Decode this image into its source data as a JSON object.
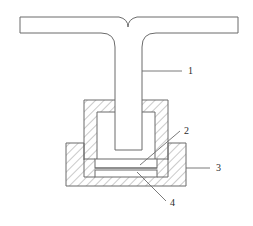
{
  "figure": {
    "domain": "engineering-cross-section-diagram",
    "background_color": "#ffffff",
    "line_color": "#6b6b6b",
    "hatch_color": "#7a7a7a",
    "text_color": "#2a2a2a",
    "width": 253,
    "height": 226
  },
  "callouts": [
    {
      "id": "callout-1",
      "label": "1",
      "refers_to": "t-section-web",
      "leader_type": "horizontal",
      "label_x": 188,
      "label_y": 74,
      "leader": {
        "x1": 142,
        "y1": 71,
        "x2": 182,
        "y2": 71
      }
    },
    {
      "id": "callout-2",
      "label": "2",
      "refers_to": "upper-thin-plate",
      "leader_type": "diagonal",
      "label_x": 184,
      "label_y": 134,
      "leader": {
        "x1": 140,
        "y1": 165,
        "x2": 180,
        "y2": 131
      }
    },
    {
      "id": "callout-3",
      "label": "3",
      "refers_to": "lower-fixture-block",
      "leader_type": "horizontal",
      "label_x": 216,
      "label_y": 171,
      "leader": {
        "x1": 186,
        "y1": 168,
        "x2": 210,
        "y2": 168
      }
    },
    {
      "id": "callout-4",
      "label": "4",
      "refers_to": "lower-thin-plate",
      "leader_type": "diagonal",
      "label_x": 170,
      "label_y": 206,
      "leader": {
        "x1": 137,
        "y1": 172,
        "x2": 166,
        "y2": 201
      }
    }
  ],
  "geometry": {
    "t_section": {
      "name": "t-section-workpiece",
      "flange": {
        "left": 20,
        "right": 238,
        "top": 17,
        "bottom": 33
      },
      "web": {
        "left": 115,
        "right": 142,
        "bottom": 150
      },
      "fillet_radius": 14,
      "notch": {
        "center_x": 128,
        "half_width": 9,
        "depth": 10
      }
    },
    "upper_block": {
      "name": "upper-fixture-block",
      "outer": {
        "left": 84,
        "right": 168,
        "top": 100,
        "bottom": 160
      },
      "cavity": {
        "left": 97,
        "right": 155,
        "top": 112,
        "bottom": 160
      }
    },
    "lower_block": {
      "name": "lower-fixture-block",
      "outer": {
        "left": 66,
        "right": 186,
        "top": 143,
        "bottom": 186
      }
    },
    "plates": [
      {
        "name": "upper-thin-plate",
        "left": 95,
        "right": 157,
        "top": 159,
        "bottom": 168
      },
      {
        "name": "lower-thin-plate",
        "left": 95,
        "right": 157,
        "top": 170,
        "bottom": 177
      }
    ]
  }
}
